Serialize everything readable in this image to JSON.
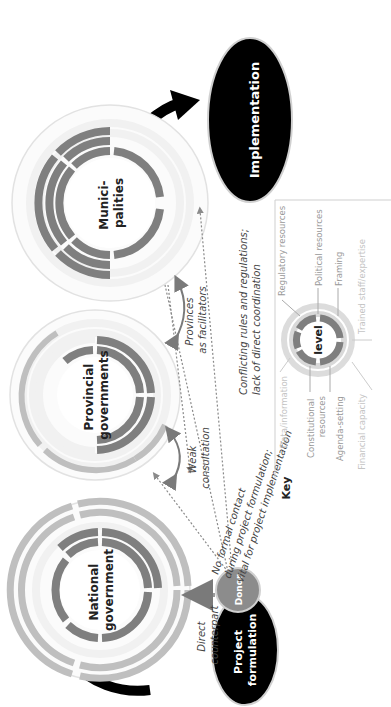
{
  "figure": {
    "orientation": "rotated-90-ccw",
    "colors": {
      "dark_segment": "#7f7f7f",
      "light_segment": "#bfbfbf",
      "faint_segment": "#ececec",
      "black_node": "#000000",
      "donor": "#8c8c8c",
      "dotted_line": "#8a8a8a",
      "arc_arrow": "#7a7a7a"
    }
  },
  "nodes": {
    "national": {
      "label_line1": "National",
      "label_line2": "government"
    },
    "provincial": {
      "label_line1": "Provincial",
      "label_line2": "governments"
    },
    "municipalities": {
      "label_line1": "Munici-",
      "label_line2": "palities"
    },
    "implementation": {
      "label": "Implementation"
    },
    "project_formulation": {
      "label_line1": "Project",
      "label_line2": "formulation"
    },
    "donor": {
      "label": "Donor"
    }
  },
  "annotations": {
    "direct_counterpart": {
      "line1": "Direct",
      "line2": "counterpart"
    },
    "weak_consultation": {
      "line1": "Weak",
      "line2": "consultation"
    },
    "provinces_facilitators": {
      "line1": "Provinces",
      "line2": "as facilitators"
    },
    "no_formal_contact": {
      "line1": "No formal contact",
      "line2": "during project formulation;",
      "line3": "vital for project implementation"
    },
    "conflicting_rules": {
      "line1": "Conflicting rules and regulations;",
      "line2": "lack of direct coordination"
    }
  },
  "key": {
    "title": "Key",
    "center_label": "level",
    "items": {
      "regulatory": "Regulatory resources",
      "political": "Political resources",
      "framing": "Framing",
      "trained_staff": "Trained staff/expertise",
      "data": "Data/information",
      "constitutional_1": "Constitutional",
      "constitutional_2": "resources",
      "agenda": "Agenda-setting",
      "financial": "Financial capacity"
    }
  }
}
